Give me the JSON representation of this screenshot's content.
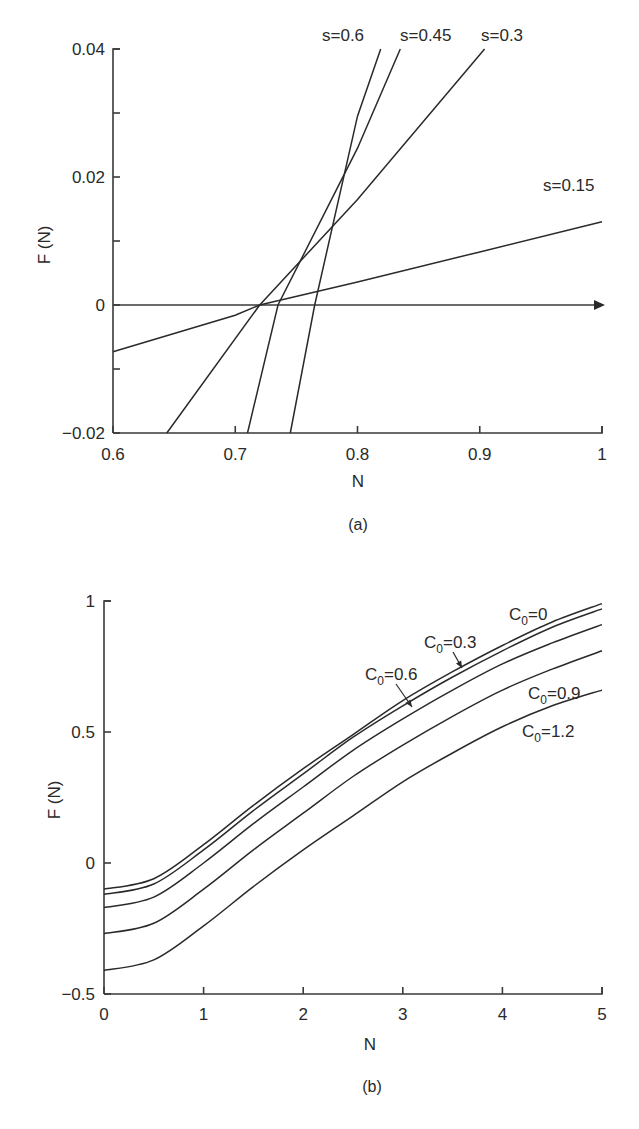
{
  "chart_data": [
    {
      "id": "a",
      "type": "line",
      "caption": "(a)",
      "title": "",
      "xlabel": "N",
      "ylabel": "F (N)",
      "xlim": [
        0.6,
        1.0
      ],
      "ylim": [
        -0.02,
        0.04
      ],
      "xticks": [
        0.6,
        0.7,
        0.8,
        0.9,
        1.0
      ],
      "xtick_labels": [
        "0.6",
        "0.7",
        "0.8",
        "0.9",
        "1"
      ],
      "yticks": [
        -0.02,
        -0.01,
        0,
        0.01,
        0.02,
        0.03,
        0.04
      ],
      "ytick_labels": [
        "−0.02",
        "",
        "0",
        "",
        "0.02",
        "",
        "0.04"
      ],
      "grid": false,
      "zero_line_arrow": true,
      "series": [
        {
          "name": "s=0.15",
          "label": "s=0.15",
          "x": [
            0.6,
            0.7,
            0.72,
            0.8,
            0.9,
            1.0
          ],
          "values": [
            -0.0073,
            -0.0016,
            0.0,
            0.0036,
            0.0083,
            0.013
          ]
        },
        {
          "name": "s=0.3",
          "label": "s=0.3",
          "x": [
            0.644,
            0.72,
            0.8,
            0.904
          ],
          "values": [
            -0.02,
            0.0,
            0.0165,
            0.04
          ]
        },
        {
          "name": "s=0.45",
          "label": "s=0.45",
          "x": [
            0.71,
            0.735,
            0.8,
            0.835
          ],
          "values": [
            -0.02,
            0.0,
            0.0245,
            0.04
          ]
        },
        {
          "name": "s=0.6",
          "label": "s=0.6",
          "x": [
            0.745,
            0.765,
            0.8,
            0.819
          ],
          "values": [
            -0.02,
            0.0,
            0.0295,
            0.04
          ]
        }
      ]
    },
    {
      "id": "b",
      "type": "line",
      "caption": "(b)",
      "title": "",
      "xlabel": "N",
      "ylabel": "F (N)",
      "xlim": [
        0,
        5
      ],
      "ylim": [
        -0.5,
        1
      ],
      "xticks": [
        0,
        1,
        2,
        3,
        4,
        5
      ],
      "xtick_labels": [
        "0",
        "1",
        "2",
        "3",
        "4",
        "5"
      ],
      "yticks": [
        -0.5,
        0,
        0.5,
        1
      ],
      "ytick_labels": [
        "−0.5",
        "0",
        "0.5",
        "1"
      ],
      "grid": false,
      "x": [
        0,
        0.5,
        1,
        1.5,
        2,
        2.5,
        3,
        3.5,
        4,
        4.5,
        5
      ],
      "series": [
        {
          "name": "C0=0",
          "label_main": "C",
          "label_sub": "0",
          "label_rest": "=0",
          "values": [
            -0.1,
            -0.06,
            0.07,
            0.22,
            0.36,
            0.49,
            0.62,
            0.73,
            0.83,
            0.92,
            0.99
          ]
        },
        {
          "name": "C0=0.3",
          "label_main": "C",
          "label_sub": "0",
          "label_rest": "=0.3",
          "values": [
            -0.12,
            -0.08,
            0.05,
            0.2,
            0.34,
            0.48,
            0.6,
            0.71,
            0.81,
            0.9,
            0.97
          ]
        },
        {
          "name": "C0=0.6",
          "label_main": "C",
          "label_sub": "0",
          "label_rest": "=0.6",
          "values": [
            -0.17,
            -0.13,
            0.0,
            0.15,
            0.29,
            0.43,
            0.55,
            0.66,
            0.76,
            0.84,
            0.91
          ]
        },
        {
          "name": "C0=0.9",
          "label_main": "C",
          "label_sub": "0",
          "label_rest": "=0.9",
          "values": [
            -0.27,
            -0.23,
            -0.1,
            0.05,
            0.19,
            0.33,
            0.45,
            0.56,
            0.66,
            0.74,
            0.81
          ]
        },
        {
          "name": "C0=1.2",
          "label_main": "C",
          "label_sub": "0",
          "label_rest": "=1.2",
          "values": [
            -0.41,
            -0.37,
            -0.24,
            -0.09,
            0.05,
            0.18,
            0.31,
            0.42,
            0.52,
            0.6,
            0.66
          ]
        }
      ]
    }
  ]
}
